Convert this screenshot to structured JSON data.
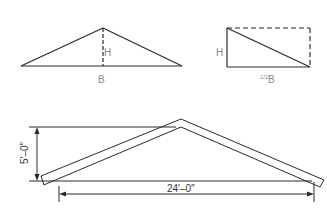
{
  "figure": {
    "triangle": {
      "height_label": "H",
      "base_label": "B"
    },
    "rectangle": {
      "height_label": "H",
      "base_label_fraction": "1/2",
      "base_label_unit": "B"
    },
    "roof": {
      "rise_label": "5′–0″",
      "span_label": "24′–0″"
    }
  },
  "colors": {
    "line": "#2a2a2a",
    "label": "#8a8a8a"
  }
}
